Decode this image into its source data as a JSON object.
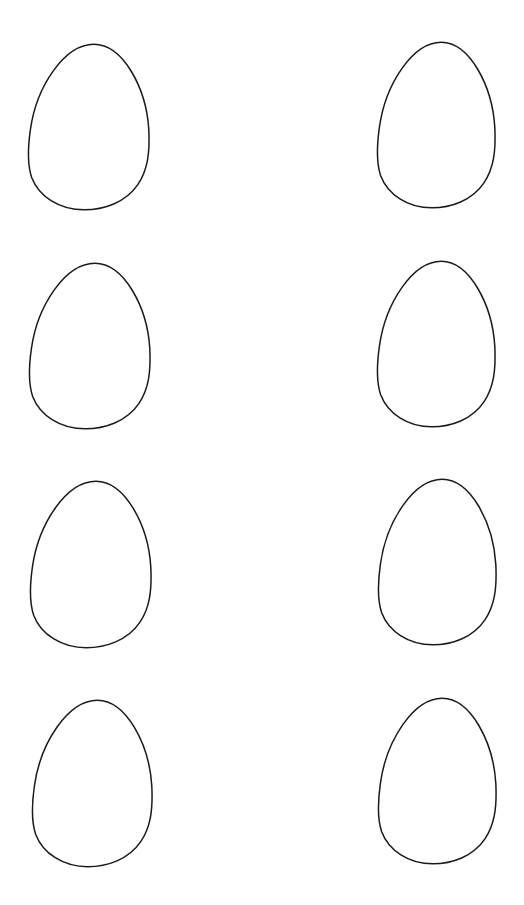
{
  "sheet": {
    "background": "#ffffff",
    "stroke_color": "#1a1a1a",
    "stroke_width": 1.5,
    "eggs": [
      {
        "id": "egg-1",
        "row": 1,
        "col": 1,
        "x": 28,
        "y": 43,
        "w": 122,
        "h": 168
      },
      {
        "id": "egg-2",
        "row": 1,
        "col": 2,
        "x": 377,
        "y": 41,
        "w": 119,
        "h": 168
      },
      {
        "id": "egg-3",
        "row": 2,
        "col": 1,
        "x": 29,
        "y": 262,
        "w": 122,
        "h": 168
      },
      {
        "id": "egg-4",
        "row": 2,
        "col": 2,
        "x": 377,
        "y": 260,
        "w": 119,
        "h": 168
      },
      {
        "id": "egg-5",
        "row": 3,
        "col": 1,
        "x": 30,
        "y": 480,
        "w": 122,
        "h": 169
      },
      {
        "id": "egg-6",
        "row": 3,
        "col": 2,
        "x": 378,
        "y": 478,
        "w": 119,
        "h": 168
      },
      {
        "id": "egg-7",
        "row": 4,
        "col": 1,
        "x": 32,
        "y": 699,
        "w": 121,
        "h": 169
      },
      {
        "id": "egg-8",
        "row": 4,
        "col": 2,
        "x": 378,
        "y": 697,
        "w": 119,
        "h": 168
      }
    ]
  }
}
